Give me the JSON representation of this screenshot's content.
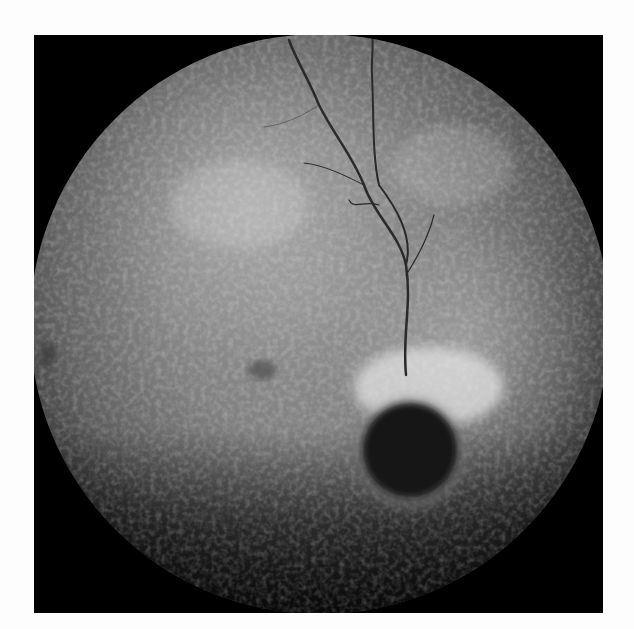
{
  "image": {
    "kind": "fundus-angiogram",
    "description": "Grayscale circular retinal fundus image on black square background with a dark round lesion near lower-right center surrounded by hyperfluorescent rim, vessels branching upward",
    "colors": {
      "page_background": "#fdfdfd",
      "frame_background": "#000000",
      "retina_mid": "#7a7a7a",
      "lesion": "#111111",
      "hyperfluorescent_rim": "#e0e0e0"
    }
  }
}
